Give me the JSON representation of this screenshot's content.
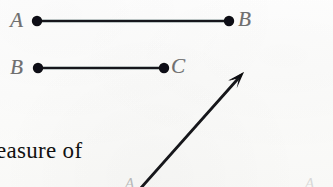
{
  "page": {
    "width": 333,
    "height": 187,
    "background_color": "#fdfdfc",
    "ink_color": "#111111",
    "label_color": "#6f6f6f",
    "faint_label_color": "#b9b9b9"
  },
  "figures": {
    "segment_ab": {
      "name": "segment AB",
      "start_label": "A",
      "end_label": "B",
      "start_point": {
        "x": 37,
        "y": 21
      },
      "end_point": {
        "x": 229,
        "y": 21
      },
      "start_label_pos": {
        "x": 10,
        "y": 10
      },
      "end_label_pos": {
        "x": 238,
        "y": 9
      },
      "dot_radius": 5.2,
      "line_width": 2.6
    },
    "segment_bc": {
      "name": "segment BC",
      "start_label": "B",
      "end_label": "C",
      "start_point": {
        "x": 38,
        "y": 68
      },
      "end_point": {
        "x": 164,
        "y": 68
      },
      "start_label_pos": {
        "x": 10,
        "y": 57
      },
      "end_label_pos": {
        "x": 171,
        "y": 56
      },
      "dot_radius": 5.2,
      "line_width": 2.6
    },
    "ray": {
      "name": "ray with arrowhead",
      "tail_point": {
        "x": 140,
        "y": 189
      },
      "tip_point": {
        "x": 244,
        "y": 72
      },
      "line_width": 2.8,
      "arrowhead_length": 17
    }
  },
  "labels": {
    "vertex_a_bottom_left": "A",
    "vertex_a_bottom_right": "A"
  },
  "text": {
    "fragment_line": "easure of"
  }
}
